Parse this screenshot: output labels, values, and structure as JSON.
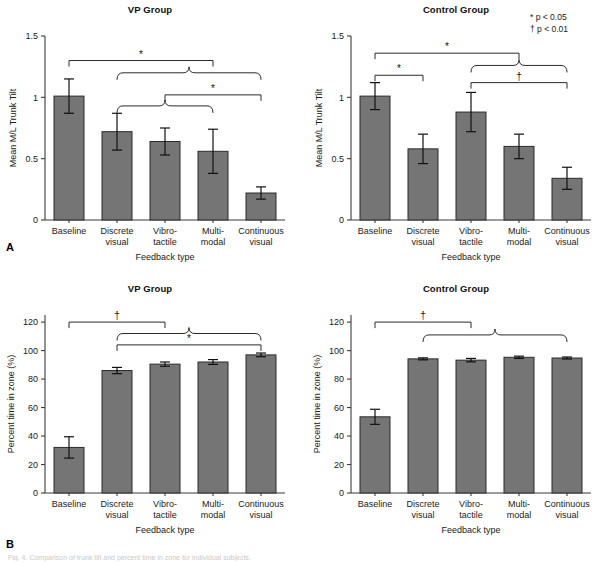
{
  "figure": {
    "panel_letters": {
      "a": "A",
      "b": "B"
    },
    "legend": {
      "star": "* p < 0.05",
      "dagger": "† p < 0.01"
    },
    "caption": "Fig. 4. Comparison of trunk tilt and percent time in zone for individual subjects.",
    "bar_color": "#757575",
    "bar_edge_color": "#2b2b2b",
    "axis_color": "#3b3b3b"
  },
  "chart_data": [
    {
      "id": "panel-a-vp",
      "type": "bar",
      "title": "VP Group",
      "xlabel": "Feedback type",
      "ylabel": "Mean M/L Trunk Tilt",
      "ylim": [
        0,
        1.5
      ],
      "yticks": [
        0,
        0.5,
        1,
        1.5
      ],
      "ytick_labels": [
        "0",
        "0.5",
        "1",
        "1.5"
      ],
      "categories": [
        "Baseline",
        "Discrete visual",
        "Vibro- tactile",
        "Multi- modal",
        "Continuous visual"
      ],
      "category_lines": [
        [
          "Baseline"
        ],
        [
          "Discrete",
          "visual"
        ],
        [
          "Vibro-",
          "tactile"
        ],
        [
          "Multi-",
          "modal"
        ],
        [
          "Continuous",
          "visual"
        ]
      ],
      "values": [
        1.01,
        0.72,
        0.64,
        0.56,
        0.22
      ],
      "errors": [
        0.14,
        0.15,
        0.11,
        0.18,
        0.05
      ],
      "grid": false,
      "legend": "none",
      "annotations": [
        {
          "symbol": "*",
          "from": 0,
          "to": 3,
          "level": 1.3
        },
        {
          "symbol": "",
          "from": 1,
          "to": 4,
          "level": 1.2,
          "brace": true
        },
        {
          "symbol": "*",
          "from": 2,
          "to": 4,
          "level": 1.02
        },
        {
          "symbol": "",
          "from": 1,
          "to": 3,
          "level": 0.93,
          "brace": true
        }
      ]
    },
    {
      "id": "panel-a-control",
      "type": "bar",
      "title": "Control Group",
      "xlabel": "Feedback type",
      "ylabel": "Mean M/L Trunk Tilt",
      "ylim": [
        0,
        1.5
      ],
      "yticks": [
        0,
        0.5,
        1,
        1.5
      ],
      "ytick_labels": [
        "0",
        "0.5",
        "1",
        "1.5"
      ],
      "categories": [
        "Baseline",
        "Discrete visual",
        "Vibro- tactile",
        "Multi- modal",
        "Continuous visual"
      ],
      "category_lines": [
        [
          "Baseline"
        ],
        [
          "Discrete",
          "visual"
        ],
        [
          "Vibro-",
          "tactile"
        ],
        [
          "Multi-",
          "modal"
        ],
        [
          "Continuous",
          "visual"
        ]
      ],
      "values": [
        1.01,
        0.58,
        0.88,
        0.6,
        0.34
      ],
      "errors": [
        0.11,
        0.12,
        0.16,
        0.1,
        0.09
      ],
      "grid": false,
      "legend": "none",
      "annotations": [
        {
          "symbol": "*",
          "from": 0,
          "to": 3,
          "level": 1.36
        },
        {
          "symbol": "",
          "from": 2,
          "to": 4,
          "level": 1.26,
          "brace": true
        },
        {
          "symbol": "*",
          "from": 0,
          "to": 1,
          "level": 1.18
        },
        {
          "symbol": "†",
          "from": 2,
          "to": 4,
          "level": 1.12
        }
      ]
    },
    {
      "id": "panel-b-vp",
      "type": "bar",
      "title": "VP Group",
      "xlabel": "Feedback type",
      "ylabel": "Percent time in zone (%)",
      "ylim": [
        0,
        125
      ],
      "yticks": [
        0,
        20,
        40,
        60,
        80,
        100,
        120
      ],
      "ytick_labels": [
        "0",
        "20",
        "40",
        "60",
        "80",
        "100",
        "120"
      ],
      "categories": [
        "Baseline",
        "Discrete visual",
        "Vibro- tactile",
        "Multi- modal",
        "Continuous visual"
      ],
      "category_lines": [
        [
          "Baseline"
        ],
        [
          "Discrete",
          "visual"
        ],
        [
          "Vibro-",
          "tactile"
        ],
        [
          "Multi-",
          "modal"
        ],
        [
          "Continuous",
          "visual"
        ]
      ],
      "values": [
        32,
        86,
        90.5,
        92,
        97
      ],
      "errors": [
        7.5,
        2.2,
        1.5,
        1.7,
        1.3
      ],
      "grid": false,
      "legend": "none",
      "annotations": [
        {
          "symbol": "†",
          "from": 0,
          "to": 2,
          "level": 120
        },
        {
          "symbol": "",
          "from": 1,
          "to": 4,
          "level": 112,
          "brace": true
        },
        {
          "symbol": "*",
          "from": 1,
          "to": 4,
          "level": 104
        }
      ]
    },
    {
      "id": "panel-b-control",
      "type": "bar",
      "title": "Control Group",
      "xlabel": "Feedback type",
      "ylabel": "Percent time in zone (%)",
      "ylim": [
        0,
        125
      ],
      "yticks": [
        0,
        20,
        40,
        60,
        80,
        100,
        120
      ],
      "ytick_labels": [
        "0",
        "20",
        "40",
        "60",
        "80",
        "100",
        "120"
      ],
      "categories": [
        "Baseline",
        "Discrete visual",
        "Vibro- tactile",
        "Multi- modal",
        "Continuous visual"
      ],
      "category_lines": [
        [
          "Baseline"
        ],
        [
          "Discrete",
          "visual"
        ],
        [
          "Vibro-",
          "tactile"
        ],
        [
          "Multi-",
          "modal"
        ],
        [
          "Continuous",
          "visual"
        ]
      ],
      "values": [
        53.5,
        94.2,
        93.3,
        95.3,
        94.8
      ],
      "errors": [
        5.3,
        0.7,
        1.2,
        0.8,
        0.7
      ],
      "grid": false,
      "legend": "none",
      "annotations": [
        {
          "symbol": "†",
          "from": 0,
          "to": 2,
          "level": 120
        },
        {
          "symbol": "",
          "from": 1,
          "to": 4,
          "level": 111,
          "brace": true
        }
      ]
    }
  ]
}
